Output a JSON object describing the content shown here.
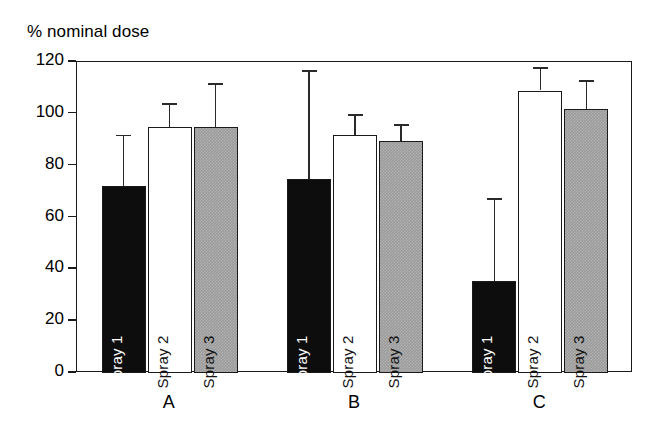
{
  "chart_data": {
    "type": "bar",
    "title": "% nominal dose",
    "xlabel": "",
    "ylabel": "% nominal dose",
    "ylim": [
      0,
      120
    ],
    "yticks": [
      0,
      20,
      40,
      60,
      80,
      100,
      120
    ],
    "ytick_labels": [
      "0",
      "20",
      "40",
      "60",
      "80",
      "100",
      "120"
    ],
    "grid": false,
    "legend": "in-bar rotated labels",
    "categories": [
      "A",
      "B",
      "C"
    ],
    "series": [
      {
        "name": "Spray 1",
        "fill": "black",
        "color": "#0d0d0d",
        "values": [
          72,
          75,
          35.5
        ],
        "errors_upper": [
          92,
          117,
          67.5
        ]
      },
      {
        "name": "Spray 2",
        "fill": "white",
        "color": "#ffffff",
        "values": [
          95,
          92,
          109
        ],
        "errors_upper": [
          104,
          100,
          118
        ]
      },
      {
        "name": "Spray 3",
        "fill": "gray",
        "color": "#9a9a9a",
        "values": [
          95,
          89.5,
          102
        ],
        "errors_upper": [
          112,
          96,
          113
        ]
      }
    ]
  }
}
